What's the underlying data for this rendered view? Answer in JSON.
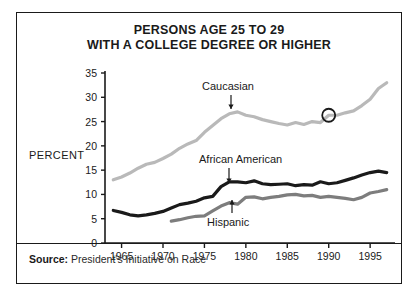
{
  "figure": {
    "title_lines": [
      "PERSONS AGE 25 TO 29",
      "WITH A COLLEGE DEGREE OR HIGHER"
    ],
    "source_label": "Source:",
    "source_text": "President's Initiative on Race",
    "axis_label_y": "PERCENT",
    "border_color": "#1a1a1a",
    "background": "#ffffff"
  },
  "annotations": {
    "caucasian_label": "Caucasian",
    "african_american_label": "African American",
    "hispanic_label": "Hispanic",
    "circle_marker": {
      "series": "Caucasian",
      "x": 1990,
      "y": 26.3,
      "color": "#1a1a1a"
    }
  },
  "chart_data": {
    "type": "line",
    "title": "PERSONS AGE 25 TO 29 WITH A COLLEGE DEGREE OR HIGHER",
    "xlabel": "",
    "ylabel": "PERCENT",
    "xlim": [
      1963,
      1998
    ],
    "ylim": [
      0,
      35
    ],
    "yticks": [
      0,
      5,
      10,
      15,
      20,
      25,
      30,
      35
    ],
    "xticks": [
      1965,
      1970,
      1975,
      1980,
      1985,
      1990,
      1995
    ],
    "grid": false,
    "legend": "inline-labels",
    "series": [
      {
        "name": "Caucasian",
        "color": "#b9b9b9",
        "width": 3.2,
        "x": [
          1964,
          1965,
          1966,
          1967,
          1968,
          1969,
          1970,
          1971,
          1972,
          1973,
          1974,
          1975,
          1976,
          1977,
          1978,
          1979,
          1980,
          1981,
          1982,
          1983,
          1984,
          1985,
          1986,
          1987,
          1988,
          1989,
          1990,
          1991,
          1992,
          1993,
          1994,
          1995,
          1996,
          1997
        ],
        "y": [
          13.0,
          13.6,
          14.4,
          15.4,
          16.2,
          16.6,
          17.4,
          18.3,
          19.5,
          20.4,
          21.1,
          22.8,
          24.2,
          25.6,
          26.6,
          27.0,
          26.3,
          26.0,
          25.4,
          25.0,
          24.6,
          24.3,
          24.8,
          24.4,
          25.0,
          24.8,
          26.3,
          26.3,
          26.8,
          27.2,
          28.3,
          29.6,
          31.8,
          33.0
        ]
      },
      {
        "name": "African American",
        "color": "#1a1a1a",
        "width": 3.2,
        "x": [
          1964,
          1965,
          1966,
          1967,
          1968,
          1969,
          1970,
          1971,
          1972,
          1973,
          1974,
          1975,
          1976,
          1977,
          1978,
          1979,
          1980,
          1981,
          1982,
          1983,
          1984,
          1985,
          1986,
          1987,
          1988,
          1989,
          1990,
          1991,
          1992,
          1993,
          1994,
          1995,
          1996,
          1997
        ],
        "y": [
          6.7,
          6.3,
          5.8,
          5.6,
          5.8,
          6.1,
          6.5,
          7.2,
          7.9,
          8.2,
          8.6,
          9.3,
          9.6,
          11.6,
          12.6,
          12.6,
          12.4,
          12.8,
          12.2,
          12.0,
          12.1,
          12.2,
          11.8,
          12.0,
          11.9,
          12.6,
          12.2,
          12.4,
          12.9,
          13.4,
          14.0,
          14.5,
          14.8,
          14.5
        ]
      },
      {
        "name": "Hispanic",
        "color": "#7d7d7d",
        "width": 3.2,
        "x": [
          1971,
          1972,
          1973,
          1974,
          1975,
          1976,
          1977,
          1978,
          1979,
          1980,
          1981,
          1982,
          1983,
          1984,
          1985,
          1986,
          1987,
          1988,
          1989,
          1990,
          1991,
          1992,
          1993,
          1994,
          1995,
          1996,
          1997
        ],
        "y": [
          4.5,
          4.8,
          5.2,
          5.5,
          5.6,
          6.6,
          7.6,
          8.3,
          8.0,
          9.4,
          9.5,
          9.1,
          9.4,
          9.6,
          9.9,
          10.0,
          9.7,
          9.8,
          9.4,
          9.6,
          9.4,
          9.2,
          8.9,
          9.4,
          10.3,
          10.6,
          11.0
        ]
      }
    ]
  }
}
